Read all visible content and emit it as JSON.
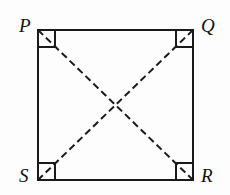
{
  "figure": {
    "type": "geometry-diagram",
    "shape": "square",
    "background_color": "#fdfdfd",
    "stroke_color": "#1a1a1a",
    "vertices": [
      {
        "id": "P",
        "label": "P",
        "corner": "top-left",
        "x": 38,
        "y": 30
      },
      {
        "id": "Q",
        "label": "Q",
        "corner": "top-right",
        "x": 193,
        "y": 30
      },
      {
        "id": "R",
        "label": "R",
        "corner": "bottom-right",
        "x": 193,
        "y": 180
      },
      {
        "id": "S",
        "label": "S",
        "corner": "bottom-left",
        "x": 38,
        "y": 180
      }
    ],
    "sides": [
      {
        "id": "PQ",
        "from": "P",
        "to": "Q",
        "style": "solid"
      },
      {
        "id": "QR",
        "from": "Q",
        "to": "R",
        "style": "solid"
      },
      {
        "id": "RS",
        "from": "R",
        "to": "S",
        "style": "solid"
      },
      {
        "id": "SP",
        "from": "S",
        "to": "P",
        "style": "solid"
      }
    ],
    "diagonals": [
      {
        "id": "PR",
        "from": "P",
        "to": "R",
        "style": "dashed"
      },
      {
        "id": "QS",
        "from": "Q",
        "to": "S",
        "style": "dashed"
      }
    ],
    "right_angle_markers": [
      {
        "id": "angle-P",
        "at": "P"
      },
      {
        "id": "angle-Q",
        "at": "Q"
      },
      {
        "id": "angle-R",
        "at": "R"
      },
      {
        "id": "angle-S",
        "at": "S"
      }
    ],
    "marker_size": 17,
    "stroke_width": 2,
    "dash_pattern": "7 4"
  }
}
